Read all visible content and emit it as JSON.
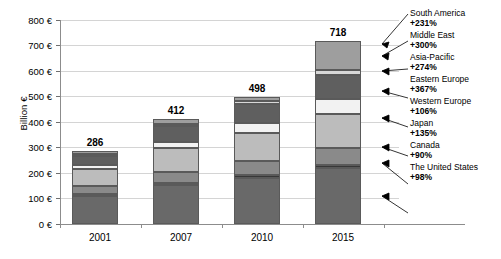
{
  "chart_data": {
    "type": "bar",
    "subtype": "stacked-bar",
    "title": "",
    "xlabel": "",
    "ylabel": "Billion €",
    "categories": [
      "2001",
      "2007",
      "2010",
      "2015"
    ],
    "totals": [
      286,
      412,
      498,
      718
    ],
    "ylim": [
      0,
      800
    ],
    "ytick_values": [
      0,
      100,
      200,
      300,
      400,
      500,
      600,
      700,
      800
    ],
    "ytick_labels": [
      "0 €",
      "100 €",
      "200 €",
      "300 €",
      "400 €",
      "500 €",
      "600 €",
      "700 €",
      "800 €"
    ],
    "grid": true,
    "legend_position": "right",
    "series": [
      {
        "name": "The United States",
        "growth": "+98%",
        "color": "#696969",
        "values": [
          110,
          152,
          180,
          218
        ]
      },
      {
        "name": "Canada",
        "growth": "+90%",
        "color": "#383838",
        "values": [
          7,
          9,
          11,
          14
        ]
      },
      {
        "name": "Japan",
        "growth": "+135%",
        "color": "#8a8a8a",
        "values": [
          32,
          44,
          55,
          68
        ]
      },
      {
        "name": "Western Europe",
        "growth": "+106%",
        "color": "#bcbcbc",
        "values": [
          68,
          92,
          110,
          130
        ]
      },
      {
        "name": "Eastern Europe",
        "growth": "+367%",
        "color": "#f2f2f2",
        "values": [
          14,
          26,
          42,
          60
        ]
      },
      {
        "name": "Asia-Pacific",
        "growth": "+274%",
        "color": "#5f5f5f",
        "values": [
          36,
          60,
          72,
          95
        ]
      },
      {
        "name": "Middle East",
        "growth": "+300%",
        "color": "#d8d8d8",
        "values": [
          6,
          10,
          14,
          20
        ]
      },
      {
        "name": "South America",
        "growth": "+231%",
        "color": "#9e9e9e",
        "values": [
          13,
          19,
          14,
          113
        ]
      }
    ]
  },
  "legend": {
    "items": [
      {
        "label": "South America",
        "pct": "+231%"
      },
      {
        "label": "Middle East",
        "pct": "+300%"
      },
      {
        "label": "Asia-Pacific",
        "pct": "+274%"
      },
      {
        "label": "Eastern Europe",
        "pct": "+367%"
      },
      {
        "label": "Western Europe",
        "pct": "+106%"
      },
      {
        "label": "Japan",
        "pct": "+135%"
      },
      {
        "label": "Canada",
        "pct": "+90%"
      },
      {
        "label": "The United States",
        "pct": "+98%"
      }
    ]
  },
  "axes": {
    "y_title": "Billion €",
    "y_labels": [
      "800 €",
      "700 €",
      "600 €",
      "500 €",
      "400 €",
      "300 €",
      "200 €",
      "100 €",
      "0 €"
    ],
    "x_labels": [
      "2001",
      "2007",
      "2010",
      "2015"
    ]
  },
  "bar_values": [
    "286",
    "412",
    "498",
    "718"
  ]
}
